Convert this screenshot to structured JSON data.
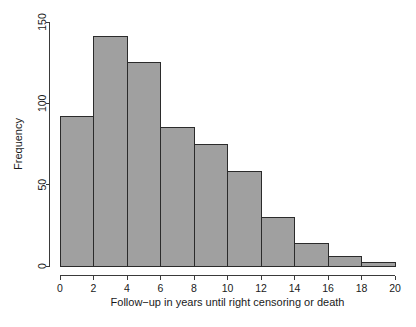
{
  "chart_data": {
    "type": "bar",
    "title": "",
    "subtitle": "",
    "xlabel": "Follow−up in years until right censoring or death",
    "ylabel": "Frequency",
    "xlim": [
      0,
      20
    ],
    "ylim": [
      0,
      150
    ],
    "grid": false,
    "legend": false,
    "legend_position": "none",
    "bin_width": 2,
    "bin_edges": [
      0,
      2,
      4,
      6,
      8,
      10,
      12,
      14,
      16,
      18,
      20
    ],
    "categories": [
      "0-2",
      "2-4",
      "4-6",
      "6-8",
      "8-10",
      "10-12",
      "12-14",
      "14-16",
      "16-18",
      "18-20"
    ],
    "values": [
      92,
      141,
      125,
      85,
      75,
      58,
      30,
      14,
      6,
      2
    ],
    "x_ticks": [
      0,
      2,
      4,
      6,
      8,
      10,
      12,
      14,
      16,
      18,
      20
    ],
    "x_tick_labels": [
      "0",
      "2",
      "4",
      "6",
      "8",
      "10",
      "12",
      "14",
      "16",
      "18",
      "20"
    ],
    "y_ticks": [
      0,
      50,
      100,
      150
    ],
    "y_tick_labels": [
      "0",
      "50",
      "100",
      "150"
    ],
    "bar_fill_color": "#a0a0a0",
    "bar_border_color": "#2b2b2b",
    "axis_color": "#3a3a3a",
    "background_color": "#ffffff"
  }
}
